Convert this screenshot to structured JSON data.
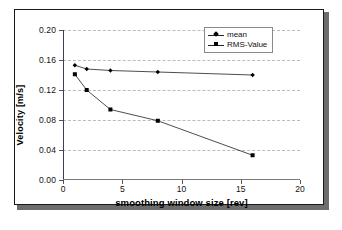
{
  "chart_data": {
    "type": "line",
    "title": "",
    "subtitle": "",
    "xlabel": "smoothing window size [rev]",
    "ylabel": "Velocity [m/s]",
    "xlim": [
      0,
      20
    ],
    "ylim": [
      0.0,
      0.2
    ],
    "xticks": [
      0,
      5,
      10,
      15,
      20
    ],
    "xtick_labels": [
      "0",
      "5",
      "10",
      "15",
      "20"
    ],
    "yticks": [
      0.0,
      0.04,
      0.08,
      0.12,
      0.16,
      0.2
    ],
    "ytick_labels": [
      "0.00",
      "0.04",
      "0.08",
      "0.12",
      "0.16",
      "0.20"
    ],
    "grid": "horizontal-dashed",
    "legend_position": "top-right",
    "x": [
      1,
      2,
      4,
      8,
      16
    ],
    "series": [
      {
        "name": "mean",
        "marker": "diamond",
        "color": "#000000",
        "values": [
          0.153,
          0.148,
          0.146,
          0.144,
          0.14
        ]
      },
      {
        "name": "RMS-Value",
        "marker": "square",
        "color": "#000000",
        "values": [
          0.141,
          0.12,
          0.094,
          0.079,
          0.033
        ]
      }
    ],
    "legend": [
      "mean",
      "RMS-Value"
    ],
    "annotations": []
  },
  "figure": {
    "frame_color": "#1a1a1a",
    "background": "#ffffff",
    "gridline_color": "#b9b9c9",
    "axis_color": "#3d3d5c"
  }
}
